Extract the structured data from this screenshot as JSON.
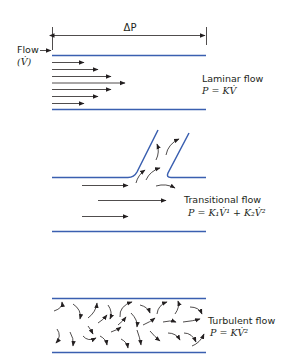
{
  "colors": {
    "pipe": "#3a5fb0",
    "ink": "#231f20",
    "background": "#ffffff"
  },
  "dimension": {
    "label": "ΔP"
  },
  "inlet": {
    "label": "Flow",
    "symbol": "(V̇)"
  },
  "panels": [
    {
      "id": "laminar",
      "title": "Laminar flow",
      "equation": "P = KV̇",
      "arrow_count": 7
    },
    {
      "id": "transitional",
      "title": "Transitional flow",
      "equation": "P = K₁V̇¹ + K₂V̇²",
      "arrow_count": 3,
      "has_branch": true
    },
    {
      "id": "turbulent",
      "title": "Turbulent flow",
      "equation": "P = KV̇²",
      "eddy_count": 30
    }
  ]
}
